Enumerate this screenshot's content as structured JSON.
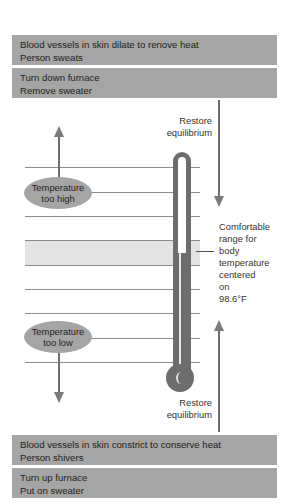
{
  "top_boxes": [
    {
      "lines": [
        "Blood vessels in skin dilate to renove heat",
        "Person sweats"
      ]
    },
    {
      "lines": [
        "Turn down furnace",
        "Remove sweater"
      ]
    }
  ],
  "bottom_boxes": [
    {
      "lines": [
        "Blood vessels in skin constrict to conserve heat",
        "Person shivers"
      ]
    },
    {
      "lines": [
        "Turn up furnace",
        "Put on sweater"
      ]
    }
  ],
  "ellipses": {
    "high": {
      "line1": "Temperature",
      "line2": "too high"
    },
    "low": {
      "line1": "Temperature",
      "line2": "too low"
    }
  },
  "labels": {
    "restore_top": {
      "line1": "Restore",
      "line2": "equilibrium"
    },
    "restore_bottom": {
      "line1": "Restore",
      "line2": "equilibrium"
    },
    "comfortable": [
      "Comfortable",
      "range for",
      "body",
      "temperature",
      "centered",
      "on",
      "98.6°F"
    ]
  },
  "colors": {
    "box_fill": "#a5a5a5",
    "band_fill": "#e3e3e3",
    "thermometer": "#6d6d6d",
    "arrow": "#7a7a7a"
  }
}
